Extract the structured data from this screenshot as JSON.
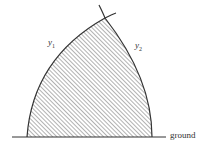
{
  "figure": {
    "type": "shaded region between two curves above ground",
    "labels": {
      "curve_left": {
        "base": "y",
        "sub": "1"
      },
      "curve_right": {
        "base": "y",
        "sub": "2"
      },
      "ground": "ground"
    },
    "colors": {
      "stroke": "#333333",
      "hatch": "#555555",
      "background": "#ffffff"
    }
  }
}
